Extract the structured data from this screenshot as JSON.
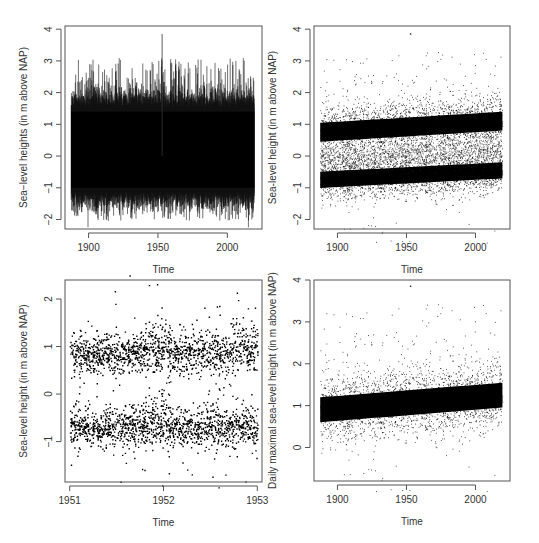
{
  "figure": {
    "width": 539,
    "height": 543,
    "axis_color": "#555555",
    "point_color": "#000000"
  },
  "chart_data": [
    {
      "id": "panel-top-left",
      "type": "line",
      "title": "",
      "xlabel": "Time",
      "ylabel": "Sea−level heights (in m above NAP)",
      "xlim": [
        1883,
        2025
      ],
      "ylim": [
        -2.3,
        4.1
      ],
      "x_range": [
        1887.5,
        2019.5
      ],
      "xticks": [
        1900,
        1950,
        2000
      ],
      "xtick_labels": [
        "1900",
        "1950",
        "2000"
      ],
      "yticks": [
        -2,
        -1,
        0,
        1,
        2,
        3,
        4
      ],
      "ytick_labels": [
        "−2",
        "−1",
        "0",
        "1",
        "2",
        "3",
        "4"
      ],
      "grid": false,
      "legend": null,
      "description": "Dense hourly/tidal sea-level series at NAP gauge; envelope roughly -1.5 to 2.2 m, extremes -2.1 to 3.85 m (peak ~1953).",
      "summary": {
        "typical_min": -1.3,
        "typical_max": 1.8,
        "min": -2.1,
        "max": 3.85,
        "max_year": 1953
      },
      "box": {
        "x": 65,
        "y": 26,
        "w": 197,
        "h": 203
      }
    },
    {
      "id": "panel-top-right",
      "type": "scatter",
      "title": "",
      "xlabel": "Time",
      "ylabel": "Sea-level height (in m above NAP)",
      "xlim": [
        1883,
        2025
      ],
      "ylim": [
        -2.3,
        4.1
      ],
      "x_range": [
        1887.5,
        2019.5
      ],
      "xticks": [
        1900,
        1950,
        2000
      ],
      "xtick_labels": [
        "1900",
        "1950",
        "2000"
      ],
      "yticks": [
        -2,
        -1,
        0,
        1,
        2,
        3,
        4
      ],
      "ytick_labels": [
        "−2",
        "−1",
        "0",
        "1",
        "2",
        "3",
        "4"
      ],
      "grid": false,
      "legend": null,
      "description": "Same series shown as points: two dense bands (high water ~0.8 m rising to ~1.1 m; low water ~-0.7 m rising to ~-0.5 m).",
      "series": [
        {
          "name": "high-water band",
          "center_start": 0.75,
          "center_end": 1.1,
          "spread": 0.35
        },
        {
          "name": "low-water band",
          "center_start": -0.75,
          "center_end": -0.45,
          "spread": 0.3
        }
      ],
      "summary": {
        "min": -2.1,
        "max": 3.85,
        "max_year": 1953
      },
      "box": {
        "x": 314,
        "y": 26,
        "w": 196,
        "h": 203
      }
    },
    {
      "id": "panel-bottom-left",
      "type": "scatter",
      "title": "",
      "xlabel": "Time",
      "ylabel": "Sea-level height (in m above NAP)",
      "xlim": [
        1950.95,
        1953.05
      ],
      "ylim": [
        -1.85,
        2.4
      ],
      "x_range": [
        1951.0,
        1953.0
      ],
      "xticks": [
        1951,
        1952,
        1953
      ],
      "xtick_labels": [
        "1951",
        "1952",
        "1953"
      ],
      "yticks": [
        -1,
        0,
        1,
        2
      ],
      "ytick_labels": [
        "−1",
        "0",
        "1",
        "2"
      ],
      "grid": false,
      "legend": null,
      "description": "Zoom 1951–1953: high-water band ~0.85 m, low-water band ~-0.7 m; storm surge near start of 1952 reaching ~2.3 m; lows to ~-1.7 m in early 1952.",
      "series": [
        {
          "name": "high-water band",
          "center": 0.85,
          "spread": 0.2
        },
        {
          "name": "low-water band",
          "center": -0.7,
          "spread": 0.2
        }
      ],
      "summary": {
        "min": -1.7,
        "max": 2.3,
        "max_time": 1951.95
      },
      "box": {
        "x": 65,
        "y": 280,
        "w": 197,
        "h": 202
      }
    },
    {
      "id": "panel-bottom-right",
      "type": "scatter",
      "title": "",
      "xlabel": "Time",
      "ylabel": "Daily maximal sea-level height (in m above NAP)",
      "xlim": [
        1883,
        2025
      ],
      "ylim": [
        -0.8,
        4.0
      ],
      "x_range": [
        1887.5,
        2019.5
      ],
      "xticks": [
        1900,
        1950,
        2000
      ],
      "xtick_labels": [
        "1900",
        "1950",
        "2000"
      ],
      "yticks": [
        0,
        1,
        2,
        3,
        4
      ],
      "ytick_labels": [
        "0",
        "1",
        "2",
        "3",
        "4"
      ],
      "grid": false,
      "legend": null,
      "description": "Daily maxima: dense cloud centered ~0.9 m (1890) rising to ~1.25 m (2020); outliers up to 3.85 m (1953), lows to ~-0.6 m.",
      "series": [
        {
          "name": "daily maxima",
          "center_start": 0.9,
          "center_end": 1.25,
          "spread": 0.35
        }
      ],
      "summary": {
        "min": -0.6,
        "max": 3.85,
        "max_year": 1953
      },
      "box": {
        "x": 314,
        "y": 280,
        "w": 196,
        "h": 201
      }
    }
  ]
}
